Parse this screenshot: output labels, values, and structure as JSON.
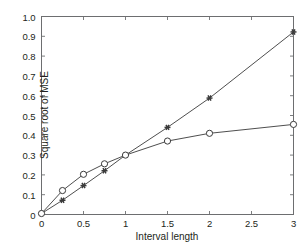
{
  "chart_data": {
    "type": "line",
    "title": "",
    "xlabel": "Interval length",
    "ylabel": "Square root of MSE",
    "xlim": [
      0,
      3
    ],
    "ylim": [
      0,
      1.0
    ],
    "grid": false,
    "legend": "none",
    "xticks": [
      0,
      0.5,
      1,
      1.5,
      2,
      2.5,
      3
    ],
    "xtick_labels": [
      "0",
      "0.5",
      "1",
      "1.5",
      "2",
      "2.5",
      "3"
    ],
    "yticks": [
      0,
      0.1,
      0.2,
      0.3,
      0.4,
      0.5,
      0.6,
      0.7,
      0.8,
      0.9,
      1.0
    ],
    "ytick_labels": [
      "0",
      "0.1",
      "0.2",
      "0.3",
      "0.4",
      "0.5",
      "0.6",
      "0.7",
      "0.8",
      "0.9",
      "1.0"
    ],
    "series": [
      {
        "name": "star-series",
        "marker": "star",
        "color": "#3a3a3a",
        "x": [
          0,
          0.25,
          0.5,
          0.75,
          1,
          1.5,
          2,
          3
        ],
        "values": [
          0.005,
          0.072,
          0.146,
          0.221,
          0.3,
          0.44,
          0.588,
          0.922
        ]
      },
      {
        "name": "circle-series",
        "marker": "circle",
        "color": "#3a3a3a",
        "x": [
          0,
          0.25,
          0.5,
          0.75,
          1,
          1.5,
          2,
          3
        ],
        "values": [
          0.005,
          0.121,
          0.203,
          0.256,
          0.3,
          0.371,
          0.41,
          0.455
        ]
      }
    ]
  },
  "axes": {
    "frame_color": "#6d6e70",
    "line_color": "#3a3a3a"
  }
}
